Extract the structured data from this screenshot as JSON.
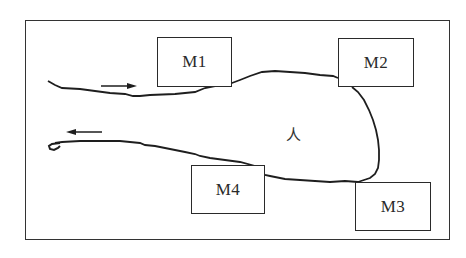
{
  "diagram": {
    "type": "schematic",
    "center_label": "人",
    "boxes": [
      {
        "id": "M1",
        "label": "M1"
      },
      {
        "id": "M2",
        "label": "M2"
      },
      {
        "id": "M3",
        "label": "M3"
      },
      {
        "id": "M4",
        "label": "M4"
      }
    ],
    "arrows": [
      {
        "direction": "right",
        "position": "upper-left, above top path"
      },
      {
        "direction": "left",
        "position": "lower-left, above bottom path"
      }
    ],
    "colors": {
      "line": "#2a2a2a",
      "background": "#ffffff"
    }
  }
}
